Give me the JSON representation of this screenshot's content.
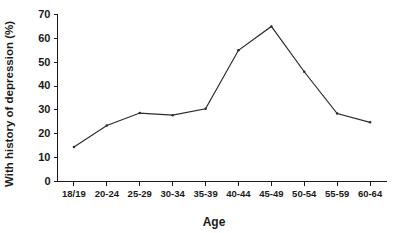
{
  "chart_data": {
    "type": "line",
    "title": "",
    "subtitle": "",
    "xlabel": "Age",
    "ylabel": "With history of depression (%)",
    "categories": [
      "18/19",
      "20-24",
      "25-29",
      "30-34",
      "35-39",
      "40-44",
      "45-49",
      "50-54",
      "55-59",
      "60-64"
    ],
    "values": [
      14.5,
      23.5,
      28.7,
      27.8,
      30.5,
      55.0,
      65.0,
      46.0,
      28.5,
      24.8
    ],
    "series": [
      {
        "name": "With history of depression (%)",
        "values": [
          14.5,
          23.5,
          28.7,
          27.8,
          30.5,
          55.0,
          65.0,
          46.0,
          28.5,
          24.8
        ]
      }
    ],
    "ylim": [
      0,
      70
    ],
    "yticks": [
      0,
      10,
      20,
      30,
      40,
      50,
      60,
      70
    ],
    "ytick_labels": [
      "0",
      "10",
      "20",
      "30",
      "40",
      "50",
      "60",
      "70"
    ],
    "xtick_labels": [
      "18/19",
      "20-24",
      "25-29",
      "30-34",
      "35-39",
      "40-44",
      "45-49",
      "50-54",
      "55-59",
      "60-64"
    ],
    "grid": false,
    "legend": false,
    "legend_position": "none",
    "line_color": "#2b2b2b",
    "axis_color": "#1a1a1a",
    "background_color": "#ffffff",
    "markers": true
  }
}
